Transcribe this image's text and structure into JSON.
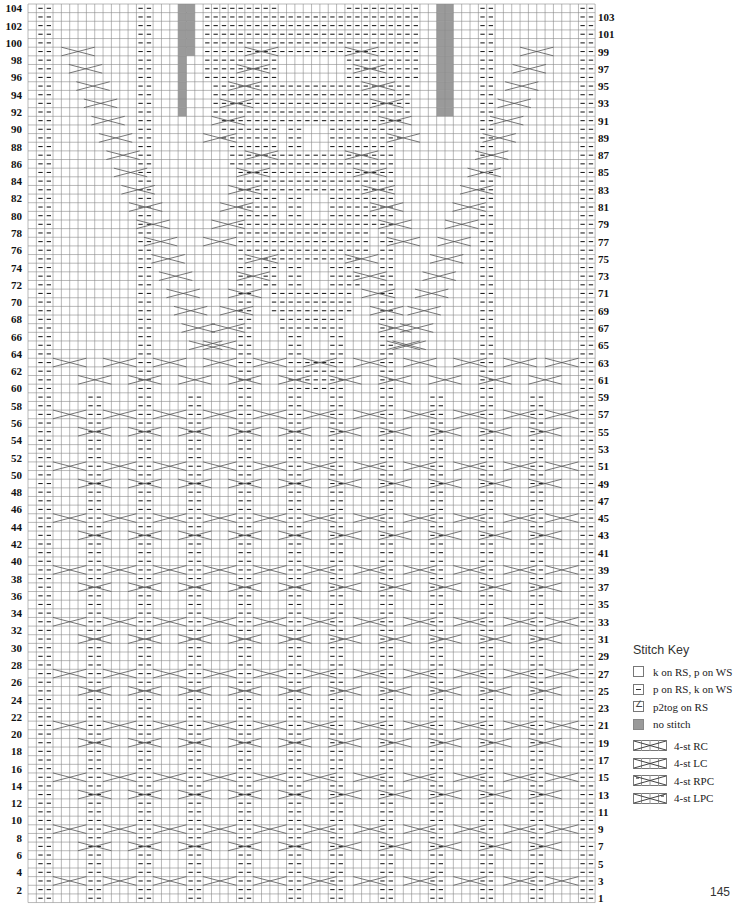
{
  "chart": {
    "rows": 104,
    "cols": 68,
    "origin_x": 28,
    "origin_y": 4,
    "cell_w": 8.34,
    "cell_h": 8.64,
    "grid_color": "#8a8a8a",
    "no_stitch_color": "#9a9a9a",
    "left_labels": [
      104,
      102,
      100,
      98,
      96,
      94,
      92,
      90,
      88,
      86,
      84,
      82,
      80,
      78,
      76,
      74,
      72,
      70,
      68,
      66,
      64,
      62,
      60,
      58,
      56,
      54,
      52,
      50,
      48,
      46,
      44,
      42,
      40,
      38,
      36,
      34,
      32,
      30,
      28,
      26,
      24,
      22,
      20,
      18,
      16,
      14,
      12,
      10,
      8,
      6,
      4,
      2
    ],
    "right_labels": [
      103,
      101,
      99,
      97,
      95,
      93,
      91,
      89,
      87,
      85,
      83,
      81,
      79,
      77,
      75,
      73,
      71,
      69,
      67,
      65,
      63,
      61,
      59,
      57,
      55,
      53,
      51,
      49,
      47,
      45,
      43,
      41,
      39,
      37,
      35,
      33,
      31,
      29,
      27,
      25,
      23,
      21,
      19,
      17,
      15,
      13,
      11,
      9,
      7,
      5,
      3,
      1
    ],
    "purl_columns_all_rows": [
      1,
      2,
      13,
      14,
      25,
      26,
      42,
      43,
      54,
      55,
      66,
      67
    ],
    "purl_columns_lower": [
      7,
      8,
      19,
      20,
      31,
      32,
      36,
      37,
      48,
      49,
      60,
      61
    ],
    "center_purl_block": {
      "from_col": 21,
      "to_col": 46,
      "from_row": 60,
      "to_row": 104
    },
    "no_stitch": [
      {
        "col": 18,
        "from_row": 92,
        "to_row": 104
      },
      {
        "col": 19,
        "from_row": 99,
        "to_row": 104
      },
      {
        "col": 49,
        "from_row": 92,
        "to_row": 104
      },
      {
        "col": 50,
        "from_row": 92,
        "to_row": 104
      }
    ],
    "cable_rows_lower": [
      3,
      7,
      9,
      13,
      15,
      19,
      21,
      25,
      27,
      31,
      33,
      37,
      39,
      43,
      45,
      49,
      51,
      55,
      57,
      61,
      63
    ],
    "cable_rows_upper": [
      65,
      67,
      69,
      71,
      73,
      75,
      77,
      79,
      81,
      83,
      85,
      87,
      89,
      91,
      93,
      95,
      97,
      99
    ]
  },
  "stitch_key": {
    "title": "Stitch Key",
    "items": [
      {
        "symbol": "knit",
        "label": "k on RS, p on WS"
      },
      {
        "symbol": "purl",
        "label": "p on RS, k on WS"
      },
      {
        "symbol": "p2tog",
        "label": "p2tog on RS"
      },
      {
        "symbol": "no-stitch",
        "label": "no stitch"
      },
      {
        "symbol": "4-st-rc",
        "label": "4-st RC"
      },
      {
        "symbol": "4-st-lc",
        "label": "4-st LC"
      },
      {
        "symbol": "4-st-rpc",
        "label": "4-st RPC"
      },
      {
        "symbol": "4-st-lpc",
        "label": "4-st LPC"
      }
    ]
  },
  "page_number": "145"
}
